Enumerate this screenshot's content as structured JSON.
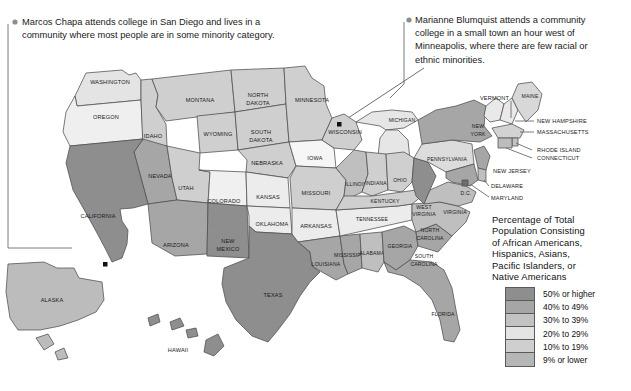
{
  "annotations": [
    {
      "id": "marcos-chapa",
      "text": "Marcos Chapa attends college in San Diego and lives in a\ncommunity where most people are in some minority category.",
      "marker": "bullet-dot"
    },
    {
      "id": "marianne-blumquist",
      "text": "Marianne Blumquist attends a community\ncollege in a small town an hour west of\nMinneapolis, where there are few racial or\nethnic minorities.",
      "marker": "bullet-dot"
    }
  ],
  "legend": {
    "title": "Percentage of Total\nPopulation Consisting\nof African Americans,\nHispanics, Asians,\nPacific Islanders, or\nNative Americans",
    "items": [
      {
        "label": "50% or higher",
        "color": "#8e8e8e"
      },
      {
        "label": "40% to 49%",
        "color": "#a6a6a6"
      },
      {
        "label": "30% to 39%",
        "color": "#c2c2c2"
      },
      {
        "label": "20% to 29%",
        "color": "#e4e4e4"
      },
      {
        "label": "10% to 19%",
        "color": "#cfcfcf"
      },
      {
        "label": "9% or lower",
        "color": "#b6b6b6"
      }
    ]
  },
  "map": {
    "ocean_color": "#ffffff",
    "border_color": "#4d4d4d",
    "cities": [
      {
        "name": "San Diego",
        "marker": "black-square-dot"
      },
      {
        "name": "Minneapolis",
        "marker": "black-square-dot"
      }
    ],
    "states": [
      {
        "name": "WASHINGTON",
        "bucket": "20% to 29%"
      },
      {
        "name": "OREGON",
        "bucket": "20% to 29%"
      },
      {
        "name": "IDAHO",
        "bucket": "10% to 19%"
      },
      {
        "name": "MONTANA",
        "bucket": "10% to 19%"
      },
      {
        "name": "WYOMING",
        "bucket": "10% to 19%"
      },
      {
        "name": "NEVADA",
        "bucket": "40% to 49%"
      },
      {
        "name": "UTAH",
        "bucket": "10% to 19%"
      },
      {
        "name": "COLORADO",
        "bucket": "20% to 29%"
      },
      {
        "name": "CALIFORNIA",
        "bucket": "50% or higher"
      },
      {
        "name": "ARIZONA",
        "bucket": "40% to 49%"
      },
      {
        "name": "NEW MEXICO",
        "bucket": "50% or higher"
      },
      {
        "name": "ALASKA",
        "bucket": "30% to 39%"
      },
      {
        "name": "HAWAII",
        "bucket": "50% or higher"
      },
      {
        "name": "NORTH DAKOTA",
        "bucket": "10% to 19%"
      },
      {
        "name": "SOUTH DAKOTA",
        "bucket": "10% to 19%"
      },
      {
        "name": "NEBRASKA",
        "bucket": "10% to 19%"
      },
      {
        "name": "KANSAS",
        "bucket": "20% to 29%"
      },
      {
        "name": "OKLAHOMA",
        "bucket": "20% to 29%"
      },
      {
        "name": "TEXAS",
        "bucket": "50% or higher"
      },
      {
        "name": "MINNESOTA",
        "bucket": "10% to 19%"
      },
      {
        "name": "IOWA",
        "bucket": "9% or lower"
      },
      {
        "name": "MISSOURI",
        "bucket": "10% to 19%"
      },
      {
        "name": "ARKANSAS",
        "bucket": "20% to 29%"
      },
      {
        "name": "LOUISIANA",
        "bucket": "40% to 49%"
      },
      {
        "name": "WISCONSIN",
        "bucket": "10% to 19%"
      },
      {
        "name": "ILLINOIS",
        "bucket": "30% to 39%"
      },
      {
        "name": "MICHIGAN",
        "bucket": "20% to 29%"
      },
      {
        "name": "INDIANA",
        "bucket": "10% to 19%"
      },
      {
        "name": "OHIO",
        "bucket": "10% to 19%"
      },
      {
        "name": "KENTUCKY",
        "bucket": "10% to 19%"
      },
      {
        "name": "TENNESSEE",
        "bucket": "20% to 29%"
      },
      {
        "name": "MISSISSIPPI",
        "bucket": "40% to 49%"
      },
      {
        "name": "ALABAMA",
        "bucket": "30% to 39%"
      },
      {
        "name": "GEORGIA",
        "bucket": "40% to 49%"
      },
      {
        "name": "FLORIDA",
        "bucket": "40% to 49%"
      },
      {
        "name": "SOUTH CAROLINA",
        "bucket": "40% to 49%"
      },
      {
        "name": "NORTH CAROLINA",
        "bucket": "30% to 39%"
      },
      {
        "name": "VIRGINIA",
        "bucket": "30% to 39%"
      },
      {
        "name": "WEST VIRGINIA",
        "bucket": "9% or lower"
      },
      {
        "name": "PENNSYLVANIA",
        "bucket": "20% to 29%"
      },
      {
        "name": "NEW YORK",
        "bucket": "40% to 49%"
      },
      {
        "name": "VERMONT",
        "bucket": "9% or lower"
      },
      {
        "name": "MAINE",
        "bucket": "9% or lower"
      },
      {
        "name": "NEW HAMPSHIRE",
        "bucket": "9% or lower"
      },
      {
        "name": "MASSACHUSETTS",
        "bucket": "20% to 29%"
      },
      {
        "name": "RHODE ISLAND",
        "bucket": "20% to 29%"
      },
      {
        "name": "CONNECTICUT",
        "bucket": "30% to 39%"
      },
      {
        "name": "NEW JERSEY",
        "bucket": "40% to 49%"
      },
      {
        "name": "DELAWARE",
        "bucket": "30% to 39%"
      },
      {
        "name": "MARYLAND",
        "bucket": "40% to 49%"
      },
      {
        "name": "D.C.",
        "bucket": "50% or higher"
      }
    ],
    "labels": {
      "washington": "WASHINGTON",
      "oregon": "OREGON",
      "idaho": "IDAHO",
      "montana": "MONTANA",
      "wyoming": "WYOMING",
      "nevada": "NEVADA",
      "utah": "UTAH",
      "colorado": "COLORADO",
      "california": "CALIFORNIA",
      "arizona": "ARIZONA",
      "new_mexico_1": "NEW",
      "new_mexico_2": "MEXICO",
      "alaska": "ALASKA",
      "hawaii": "HAWAII",
      "north_dakota_1": "NORTH",
      "north_dakota_2": "DAKOTA",
      "south_dakota_1": "SOUTH",
      "south_dakota_2": "DAKOTA",
      "nebraska": "NEBRASKA",
      "kansas": "KANSAS",
      "oklahoma": "OKLAHOMA",
      "texas": "TEXAS",
      "minnesota": "MINNESOTA",
      "iowa": "IOWA",
      "missouri": "MISSOURI",
      "arkansas": "ARKANSAS",
      "louisiana": "LOUISIANA",
      "wisconsin": "WISCONSIN",
      "illinois": "ILLINOIS",
      "michigan": "MICHIGAN",
      "indiana": "INDIANA",
      "ohio": "OHIO",
      "kentucky": "KENTUCKY",
      "tennessee": "TENNESSEE",
      "mississippi": "MISSISSIPPI",
      "alabama": "ALABAMA",
      "georgia": "GEORGIA",
      "florida": "FLORIDA",
      "south_carolina_1": "SOUTH",
      "south_carolina_2": "CAROLINA",
      "north_carolina_1": "NORTH",
      "north_carolina_2": "CAROLINA",
      "virginia": "VIRGINIA",
      "west_virginia_1": "WEST",
      "west_virginia_2": "VIRGINIA",
      "pennsylvania": "PENNSYLVANIA",
      "new_york_1": "NEW",
      "new_york_2": "YORK",
      "vermont": "VERMONT",
      "maine": "MAINE",
      "new_hampshire": "NEW HAMPSHIRE",
      "massachusetts": "MASSACHUSETTS",
      "rhode_island": "RHODE ISLAND",
      "connecticut": "CONNECTICUT",
      "new_jersey": "NEW JERSEY",
      "delaware": "DELAWARE",
      "maryland": "MARYLAND",
      "dc": "D.C."
    }
  }
}
